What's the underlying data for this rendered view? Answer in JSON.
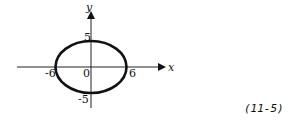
{
  "diagram": {
    "type": "ellipse-graph",
    "axes": {
      "x_label": "x",
      "y_label": "y"
    },
    "ticks": {
      "x_neg": "-6",
      "x_pos": "6",
      "y_pos": "5",
      "y_neg": "-5",
      "origin": "0"
    },
    "ellipse": {
      "center": [
        0,
        0
      ],
      "semi_major_x": 6,
      "semi_minor_y": 5
    },
    "equation_number": "(11-5)"
  }
}
